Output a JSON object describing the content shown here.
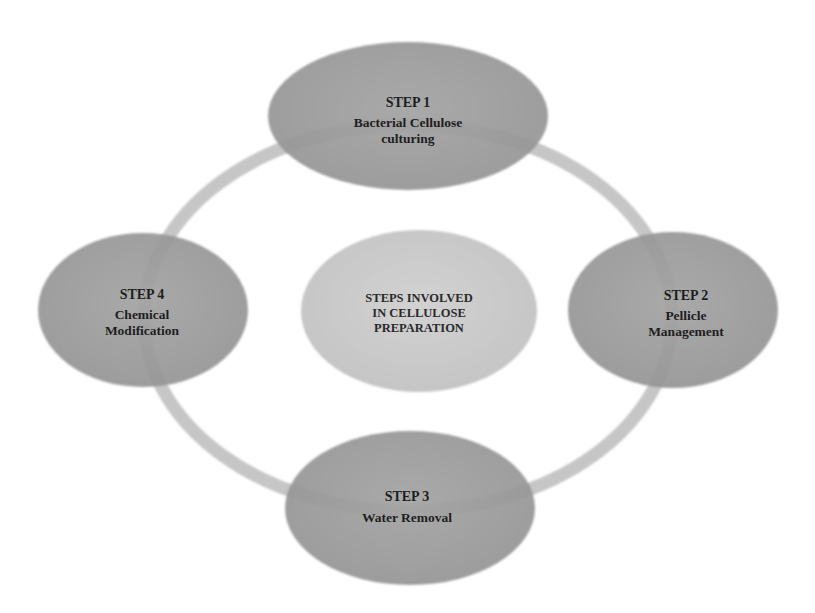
{
  "diagram": {
    "type": "cycle",
    "center": {
      "lines": [
        "STEPS INVOLVED",
        "IN CELLULOSE",
        "PREPARATION"
      ]
    },
    "steps": [
      {
        "id": "step-1",
        "title": "STEP 1",
        "lines": [
          "Bacterial Cellulose",
          "culturing"
        ]
      },
      {
        "id": "step-2",
        "title": "STEP 2",
        "lines": [
          "Pellicle",
          "Management"
        ]
      },
      {
        "id": "step-3",
        "title": "STEP 3",
        "lines": [
          "Water Removal"
        ]
      },
      {
        "id": "step-4",
        "title": "STEP 4",
        "lines": [
          "Chemical",
          "Modification"
        ]
      }
    ],
    "colors": {
      "background": "#ffffff",
      "ring": "#c6c6c6",
      "step_fill": "#9c9c9c",
      "center_fill": "#cdcdcd",
      "text": "#1e1e1e"
    }
  }
}
